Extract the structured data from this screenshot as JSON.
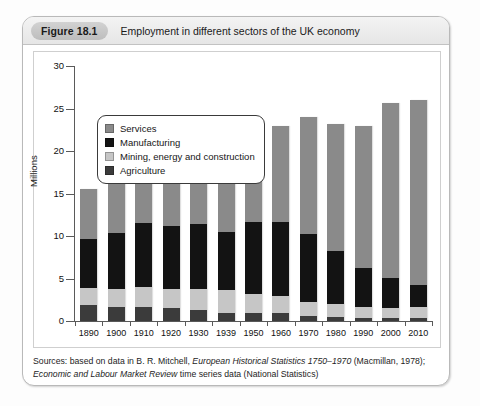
{
  "figure": {
    "label": "Figure 18.1",
    "caption": "Employment in different sectors of the UK economy"
  },
  "colors": {
    "services": "#8a8a8a",
    "manufacturing": "#131313",
    "mining": "#c6c6c6",
    "agriculture": "#3b3b3b",
    "axis": "#5a5a5a",
    "panel_border": "#cfcfcf",
    "box_border": "#b9b9b9"
  },
  "legend": {
    "items": [
      {
        "label": "Services",
        "swatch": "#8a8a8a"
      },
      {
        "label": "Manufacturing",
        "swatch": "#131313"
      },
      {
        "label": "Mining, energy and construction",
        "swatch": "#c6c6c6"
      },
      {
        "label": "Agriculture",
        "swatch": "#3b3b3b"
      }
    ]
  },
  "sources": {
    "line1_a": "Sources: based on data in B. R. Mitchell, ",
    "line1_italic": "European Historical Statistics 1750–1970",
    "line1_b": " (Macmillan, 1978);",
    "line2_italic": "Economic and Labour Market Review",
    "line2_b": " time series data (National Statistics)"
  },
  "chart_data": {
    "type": "bar",
    "stacked": true,
    "title": "Employment in different sectors of the UK economy",
    "xlabel": "",
    "ylabel": "Millions",
    "ylim": [
      0,
      30
    ],
    "yticks": [
      0,
      5,
      10,
      15,
      20,
      25,
      30
    ],
    "grid": false,
    "legend_position": "top-left",
    "categories": [
      "1890",
      "1900",
      "1910",
      "1920",
      "1930",
      "1939",
      "1950",
      "1960",
      "1970",
      "1980",
      "1990",
      "2000",
      "2010"
    ],
    "series": [
      {
        "name": "Agriculture",
        "color": "#3b3b3b",
        "values": [
          1.9,
          1.7,
          1.7,
          1.5,
          1.3,
          1.0,
          1.0,
          0.9,
          0.6,
          0.5,
          0.4,
          0.3,
          0.3
        ]
      },
      {
        "name": "Mining, energy and construction",
        "color": "#c6c6c6",
        "values": [
          2.0,
          2.1,
          2.3,
          2.3,
          2.5,
          2.6,
          2.2,
          2.1,
          1.6,
          1.5,
          1.2,
          1.2,
          1.3
        ]
      },
      {
        "name": "Manufacturing",
        "color": "#131313",
        "values": [
          5.7,
          6.6,
          7.5,
          7.4,
          7.6,
          6.9,
          8.4,
          8.7,
          8.0,
          6.2,
          4.6,
          3.6,
          2.6
        ]
      },
      {
        "name": "Services",
        "color": "#8a8a8a",
        "values": [
          5.9,
          5.9,
          6.7,
          8.5,
          10.0,
          10.6,
          11.0,
          11.2,
          13.8,
          15.0,
          16.8,
          20.5,
          21.8
        ]
      }
    ],
    "totals": [
      15.5,
      16.3,
      18.2,
      19.7,
      21.4,
      21.1,
      22.6,
      22.9,
      24.0,
      23.2,
      23.0,
      25.6,
      26.0
    ]
  }
}
